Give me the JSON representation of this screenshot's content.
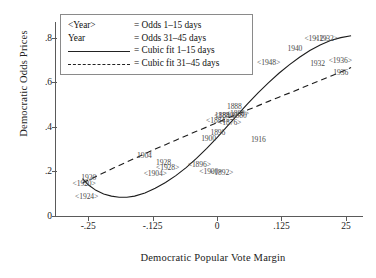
{
  "chart_data": {
    "type": "scatter",
    "title": "",
    "xlabel": "Democratic Popular Vote Margin",
    "ylabel": "Democratic Odds Prices",
    "xlim": [
      -0.3125,
      0.2812
    ],
    "ylim": [
      0.0,
      0.87
    ],
    "xticks": [
      "-.25",
      "-.125",
      "0",
      ".125",
      "25"
    ],
    "xtick_values": [
      -0.25,
      -0.125,
      0,
      0.125,
      0.25
    ],
    "yticks": [
      "0",
      ".2",
      ".4",
      ".6",
      ".8"
    ],
    "ytick_values": [
      0,
      0.2,
      0.4,
      0.6,
      0.8
    ],
    "grid": false,
    "legend_position": "top-left",
    "legend": {
      "rows": [
        {
          "key": "<Year>",
          "eq": "= Odds 1–15 days",
          "marker": "text"
        },
        {
          "key": "Year",
          "eq": "= Odds 31–45 days",
          "marker": "text"
        },
        {
          "key": "",
          "eq": "= Cubic fit 1–15 days",
          "marker": "solid"
        },
        {
          "key": "",
          "eq": "= Cubic fit 31–45 days",
          "marker": "dashed"
        }
      ]
    },
    "series": [
      {
        "name": "Odds 1-15 days",
        "label_style": "angle-bracket",
        "points": [
          {
            "label": "<1924>",
            "x": -0.253,
            "y": 0.09
          },
          {
            "label": "<1920>",
            "x": -0.258,
            "y": 0.15
          },
          {
            "label": "<1904>",
            "x": -0.12,
            "y": 0.195
          },
          {
            "label": "<1928>",
            "x": -0.096,
            "y": 0.218
          },
          {
            "label": "<1896>",
            "x": -0.0345,
            "y": 0.233
          },
          {
            "label": "<1900>",
            "x": -0.012,
            "y": 0.2
          },
          {
            "label": "<1892>",
            "x": 0.009,
            "y": 0.196
          },
          {
            "label": "<1884>",
            "x": 0.001,
            "y": 0.43
          },
          {
            "label": "<1876>",
            "x": 0.0245,
            "y": 0.42
          },
          {
            "label": "<1880>",
            "x": 0.017,
            "y": 0.455
          },
          {
            "label": "<1888>",
            "x": 0.0395,
            "y": 0.462
          },
          {
            "label": "<1912>",
            "x": 0.192,
            "y": 0.8
          },
          {
            "label": "<1932>",
            "x": 0.212,
            "y": 0.8
          },
          {
            "label": "<1948>",
            "x": 0.1,
            "y": 0.69
          },
          {
            "label": "<1936>",
            "x": 0.239,
            "y": 0.7
          }
        ]
      },
      {
        "name": "Odds 31-45 days",
        "label_style": "plain",
        "points": [
          {
            "label": "1920",
            "x": -0.249,
            "y": 0.177
          },
          {
            "label": "1904",
            "x": -0.141,
            "y": 0.275
          },
          {
            "label": "1928",
            "x": -0.104,
            "y": 0.243
          },
          {
            "label": "1900",
            "x": -0.0165,
            "y": 0.348
          },
          {
            "label": "1896",
            "x": 0.0015,
            "y": 0.375
          },
          {
            "label": "1888",
            "x": 0.0335,
            "y": 0.492
          },
          {
            "label": "1884",
            "x": 0.01,
            "y": 0.455
          },
          {
            "label": "1880",
            "x": 0.043,
            "y": 0.455
          },
          {
            "label": "1916",
            "x": 0.08,
            "y": 0.345
          },
          {
            "label": "1940",
            "x": 0.151,
            "y": 0.752
          },
          {
            "label": "1932",
            "x": 0.195,
            "y": 0.685
          },
          {
            "label": "1936",
            "x": 0.24,
            "y": 0.648
          }
        ]
      }
    ],
    "fits": [
      {
        "name": "Cubic fit 1-15 days",
        "style": "solid",
        "path": [
          [
            -0.261,
            0.168
          ],
          [
            -0.25,
            0.14
          ],
          [
            -0.235,
            0.115
          ],
          [
            -0.22,
            0.099
          ],
          [
            -0.205,
            0.089
          ],
          [
            -0.19,
            0.084
          ],
          [
            -0.175,
            0.084
          ],
          [
            -0.16,
            0.089
          ],
          [
            -0.14,
            0.103
          ],
          [
            -0.12,
            0.124
          ],
          [
            -0.1,
            0.15
          ],
          [
            -0.08,
            0.181
          ],
          [
            -0.06,
            0.217
          ],
          [
            -0.04,
            0.258
          ],
          [
            -0.02,
            0.303
          ],
          [
            0.0,
            0.352
          ],
          [
            0.02,
            0.403
          ],
          [
            0.04,
            0.455
          ],
          [
            0.06,
            0.505
          ],
          [
            0.08,
            0.553
          ],
          [
            0.1,
            0.598
          ],
          [
            0.12,
            0.64
          ],
          [
            0.14,
            0.678
          ],
          [
            0.16,
            0.712
          ],
          [
            0.18,
            0.742
          ],
          [
            0.2,
            0.767
          ],
          [
            0.22,
            0.787
          ],
          [
            0.24,
            0.8
          ],
          [
            0.26,
            0.808
          ]
        ]
      },
      {
        "name": "Cubic fit 31-45 days",
        "style": "dashed",
        "path": [
          [
            -0.261,
            0.148
          ],
          [
            -0.24,
            0.172
          ],
          [
            -0.22,
            0.194
          ],
          [
            -0.2,
            0.216
          ],
          [
            -0.18,
            0.237
          ],
          [
            -0.16,
            0.258
          ],
          [
            -0.14,
            0.279
          ],
          [
            -0.12,
            0.3
          ],
          [
            -0.1,
            0.32
          ],
          [
            -0.08,
            0.34
          ],
          [
            -0.06,
            0.36
          ],
          [
            -0.04,
            0.38
          ],
          [
            -0.02,
            0.399
          ],
          [
            0.0,
            0.419
          ],
          [
            0.02,
            0.438
          ],
          [
            0.04,
            0.457
          ],
          [
            0.06,
            0.476
          ],
          [
            0.08,
            0.495
          ],
          [
            0.1,
            0.514
          ],
          [
            0.12,
            0.533
          ],
          [
            0.14,
            0.551
          ],
          [
            0.16,
            0.57
          ],
          [
            0.18,
            0.589
          ],
          [
            0.2,
            0.608
          ],
          [
            0.22,
            0.627
          ],
          [
            0.24,
            0.646
          ],
          [
            0.26,
            0.666
          ]
        ]
      }
    ]
  },
  "colors": {
    "axis": "#5a5a5a",
    "fit_line": "#1c1c1c",
    "point_label": "#4a4a4a",
    "legend_border": "#8a8a8a",
    "background": "#ffffff"
  }
}
